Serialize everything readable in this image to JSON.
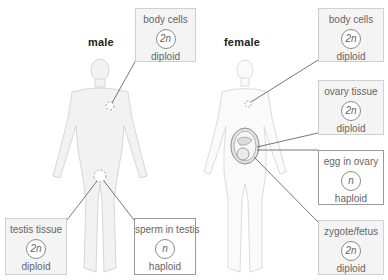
{
  "figures": {
    "male": {
      "label": "male"
    },
    "female": {
      "label": "female"
    }
  },
  "boxes": {
    "male_body_cells": {
      "title": "body cells",
      "ploidy": "2n",
      "state": "diploid"
    },
    "testis_tissue": {
      "title": "testis tissue",
      "ploidy": "2n",
      "state": "diploid"
    },
    "sperm_in_testis": {
      "title": "sperm in testis",
      "ploidy": "n",
      "state": "haploid"
    },
    "female_body_cells": {
      "title": "body cells",
      "ploidy": "2n",
      "state": "diploid"
    },
    "ovary_tissue": {
      "title": "ovary tissue",
      "ploidy": "2n",
      "state": "diploid"
    },
    "egg_in_ovary": {
      "title": "egg in ovary",
      "ploidy": "n",
      "state": "haploid"
    },
    "zygote_fetus": {
      "title": "zygote/fetus",
      "ploidy": "2n",
      "state": "diploid"
    }
  },
  "colors": {
    "diploid_box_fill": "#f4f4f4",
    "haploid_box_fill": "#ffffff",
    "leader_line": "#555555",
    "body_outline": "#d8d8d8"
  }
}
